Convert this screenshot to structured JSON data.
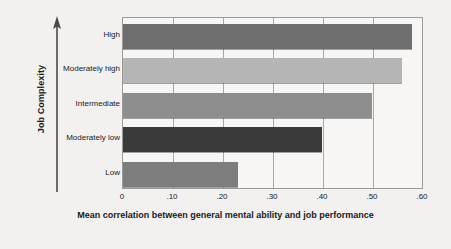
{
  "chart_data": {
    "type": "bar",
    "orientation": "horizontal",
    "title": "",
    "categories": [
      "High",
      "Moderately high",
      "Intermediate",
      "Moderately low",
      "Low"
    ],
    "values": [
      0.58,
      0.56,
      0.5,
      0.4,
      0.23
    ],
    "xlabel": "Mean correlation between general mental ability and job performance",
    "ylabel": "Job Complexity",
    "xlim": [
      0,
      0.6
    ],
    "xticks": [
      "0",
      ".10",
      ".20",
      ".30",
      ".40",
      ".50",
      ".60"
    ],
    "xtick_values": [
      0,
      0.1,
      0.2,
      0.3,
      0.4,
      0.5,
      0.6
    ],
    "grid": true,
    "legend": "none",
    "bar_colors": [
      "#6e6e6e",
      "#b5b5b5",
      "#8e8e8e",
      "#3a3a3a",
      "#7d7d7d"
    ],
    "background_color": "#f2f1ef",
    "plot_background_color": "#f7f6f4",
    "axis_color": "#9a9a9a"
  }
}
